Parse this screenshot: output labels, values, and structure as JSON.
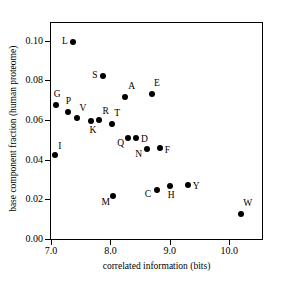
{
  "chart_data": {
    "type": "scatter",
    "title": "",
    "xlabel": "correlated information (bits)",
    "ylabel": "base component fraction (human proteome)",
    "xlim": [
      7.0,
      10.55
    ],
    "ylim": [
      0.0,
      0.109
    ],
    "grid": false,
    "legend": "none",
    "xticks": [
      "7.0",
      "8.0",
      "9.0",
      "10.0"
    ],
    "xtickvalues": [
      7.0,
      8.0,
      9.0,
      10.0
    ],
    "yticks": [
      "0.00",
      "0.02",
      "0.04",
      "0.06",
      "0.08",
      "0.10"
    ],
    "ytickvalues": [
      0.0,
      0.02,
      0.04,
      0.06,
      0.08,
      0.1
    ],
    "marker": "filled-circle",
    "marker_color": "#000000",
    "points": [
      {
        "label": "L",
        "x": 7.37,
        "y": 0.0995,
        "lx": -11,
        "ly": -5
      },
      {
        "label": "S",
        "x": 7.88,
        "y": 0.0822,
        "lx": -11,
        "ly": -5
      },
      {
        "label": "G",
        "x": 7.08,
        "y": 0.0678,
        "lx": -2,
        "ly": -15
      },
      {
        "label": "A",
        "x": 8.25,
        "y": 0.0715,
        "lx": 3,
        "ly": -15
      },
      {
        "label": "E",
        "x": 8.7,
        "y": 0.073,
        "lx": 2,
        "ly": -15
      },
      {
        "label": "P",
        "x": 7.28,
        "y": 0.0643,
        "lx": -2,
        "ly": -15
      },
      {
        "label": "V",
        "x": 7.43,
        "y": 0.0612,
        "lx": 3,
        "ly": -14
      },
      {
        "label": "K",
        "x": 7.68,
        "y": 0.0596,
        "lx": -2,
        "ly": 5
      },
      {
        "label": "R",
        "x": 7.8,
        "y": 0.06,
        "lx": 4,
        "ly": -13
      },
      {
        "label": "T",
        "x": 8.03,
        "y": 0.058,
        "lx": 2,
        "ly": -15
      },
      {
        "label": "I",
        "x": 7.07,
        "y": 0.0425,
        "lx": 3,
        "ly": -13
      },
      {
        "label": "Q",
        "x": 8.3,
        "y": 0.0512,
        "lx": -11,
        "ly": 1
      },
      {
        "label": "D",
        "x": 8.43,
        "y": 0.0512,
        "lx": 5,
        "ly": -3
      },
      {
        "label": "N",
        "x": 8.62,
        "y": 0.0452,
        "lx": -12,
        "ly": 1
      },
      {
        "label": "F",
        "x": 8.83,
        "y": 0.0458,
        "lx": 5,
        "ly": -2
      },
      {
        "label": "C",
        "x": 8.78,
        "y": 0.0248,
        "lx": -12,
        "ly": 0
      },
      {
        "label": "H",
        "x": 9.0,
        "y": 0.0265,
        "lx": -2,
        "ly": 5
      },
      {
        "label": "Y",
        "x": 9.3,
        "y": 0.0272,
        "lx": 5,
        "ly": -3
      },
      {
        "label": "M",
        "x": 8.05,
        "y": 0.0215,
        "lx": -12,
        "ly": 2
      },
      {
        "label": "W",
        "x": 10.2,
        "y": 0.0125,
        "lx": 2,
        "ly": -15
      }
    ]
  }
}
